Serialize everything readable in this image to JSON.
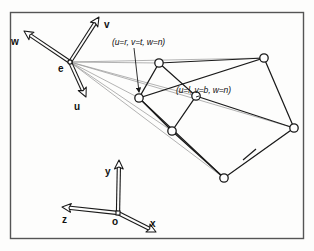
{
  "figure": {
    "background_color": "#fdfdfc",
    "ink_color": "#1a1a1a",
    "ray_color": "#8a8a8a",
    "frame": {
      "x": 10,
      "y": 12,
      "w": 293,
      "h": 226,
      "border_color": "#555555"
    }
  },
  "eye_frame": {
    "origin_label": "e",
    "origin": {
      "x": 70,
      "y": 62
    },
    "axes": [
      {
        "name": "v",
        "label": "v",
        "tip": {
          "x": 99,
          "y": 17
        },
        "label_pos": {
          "x": 104,
          "y": 19
        }
      },
      {
        "name": "w",
        "label": "w",
        "tip": {
          "x": 24,
          "y": 31
        },
        "label_pos": {
          "x": 11,
          "y": 36
        }
      },
      {
        "name": "u",
        "label": "u",
        "tip": {
          "x": 86,
          "y": 97
        },
        "label_pos": {
          "x": 74,
          "y": 101
        }
      }
    ],
    "origin_label_pos": {
      "x": 58,
      "y": 63
    }
  },
  "world_frame": {
    "origin_label": "o",
    "origin": {
      "x": 118,
      "y": 213
    },
    "axes": [
      {
        "name": "y",
        "label": "y",
        "tip": {
          "x": 119,
          "y": 160
        },
        "label_pos": {
          "x": 105,
          "y": 166
        }
      },
      {
        "name": "z",
        "label": "z",
        "tip": {
          "x": 62,
          "y": 207
        },
        "label_pos": {
          "x": 62,
          "y": 214
        }
      },
      {
        "name": "x",
        "label": "x",
        "tip": {
          "x": 156,
          "y": 232
        },
        "label_pos": {
          "x": 150,
          "y": 218
        }
      }
    ],
    "origin_label_pos": {
      "x": 112,
      "y": 216
    }
  },
  "annotations": [
    {
      "id": "near-top-right-corner",
      "text": "(u=r, v=t, w=n)",
      "text_pos": {
        "x": 112,
        "y": 37
      },
      "leader": {
        "x1": 134,
        "y1": 48,
        "x2": 139,
        "y2": 92
      },
      "arrow": true
    },
    {
      "id": "near-bottom-left-corner",
      "text": "(u=l, v=b, w=n)",
      "text_pos": {
        "x": 176,
        "y": 85
      },
      "leader": {
        "x1": 199,
        "y1": 96,
        "x2": 196,
        "y2": 97
      },
      "arrow": false
    }
  ],
  "frustum": {
    "description": "Truncated pyramid view volume with near and far quadrilateral faces",
    "near_plane": {
      "name": "near-plane",
      "vertices": [
        {
          "id": "n-top",
          "x": 159,
          "y": 63
        },
        {
          "id": "n-right",
          "x": 196,
          "y": 96
        },
        {
          "id": "n-bottom",
          "x": 172,
          "y": 131
        },
        {
          "id": "n-left",
          "x": 139,
          "y": 98
        }
      ]
    },
    "far_plane": {
      "name": "far-plane",
      "vertices": [
        {
          "id": "f-top",
          "x": 264,
          "y": 58
        },
        {
          "id": "f-right",
          "x": 294,
          "y": 128
        },
        {
          "id": "f-bottom",
          "x": 224,
          "y": 178
        },
        {
          "id": "f-left",
          "x": 139,
          "y": 98
        }
      ]
    },
    "side_edges": [
      {
        "from": "n-top",
        "to": "f-top"
      },
      {
        "from": "n-right",
        "to": "f-right"
      },
      {
        "from": "n-bottom",
        "to": "f-bottom"
      },
      {
        "from": "n-left",
        "to": "f-left"
      }
    ],
    "tick_mark": {
      "x1": 243,
      "y1": 160,
      "x2": 256,
      "y2": 149
    },
    "node_radius": 4.2
  },
  "eye_rays": [
    {
      "to": {
        "x": 159,
        "y": 63
      }
    },
    {
      "to": {
        "x": 196,
        "y": 96
      }
    },
    {
      "to": {
        "x": 172,
        "y": 131
      }
    },
    {
      "to": {
        "x": 139,
        "y": 98
      }
    },
    {
      "to": {
        "x": 264,
        "y": 58
      }
    },
    {
      "to": {
        "x": 294,
        "y": 128
      }
    },
    {
      "to": {
        "x": 224,
        "y": 178
      }
    }
  ]
}
